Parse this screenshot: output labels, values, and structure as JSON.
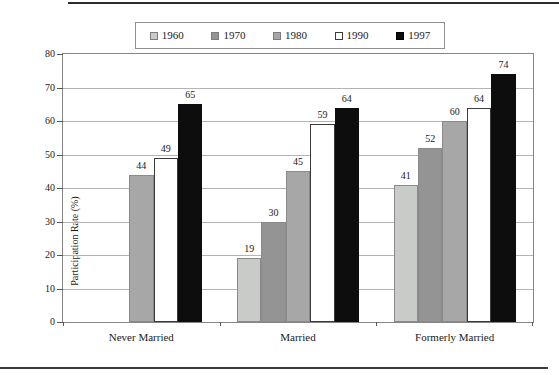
{
  "chart_data": {
    "type": "bar",
    "title": "",
    "categories": [
      "Never Married",
      "Married",
      "Formerly Married"
    ],
    "series": [
      {
        "name": "1960",
        "color": "#c9cbc9",
        "values": [
          null,
          19,
          41
        ]
      },
      {
        "name": "1970",
        "color": "#949494",
        "values": [
          null,
          30,
          52
        ]
      },
      {
        "name": "1980",
        "color": "#a7a7a7",
        "values": [
          44,
          45,
          60
        ]
      },
      {
        "name": "1990",
        "color": "#ffffff",
        "values": [
          49,
          59,
          64
        ]
      },
      {
        "name": "1997",
        "color": "#0d0d0d",
        "values": [
          65,
          64,
          74
        ]
      }
    ],
    "xlabel": "",
    "ylabel": "Participation Rate (%)",
    "ylim": [
      0,
      80
    ],
    "ytick_step": 10,
    "yticks": [
      0,
      10,
      20,
      30,
      40,
      50,
      60,
      70,
      80
    ],
    "grid": true,
    "legend_position": "top-center",
    "value_labels": true
  },
  "colors": {
    "grid_line": "#b4b4b4",
    "plot_border": "#858585",
    "white_bar_outline": "#3a3a3a",
    "gray_bar_outline": "#8a8a8a",
    "rule": "#2b2b2b",
    "text": "#1a1a1a"
  }
}
